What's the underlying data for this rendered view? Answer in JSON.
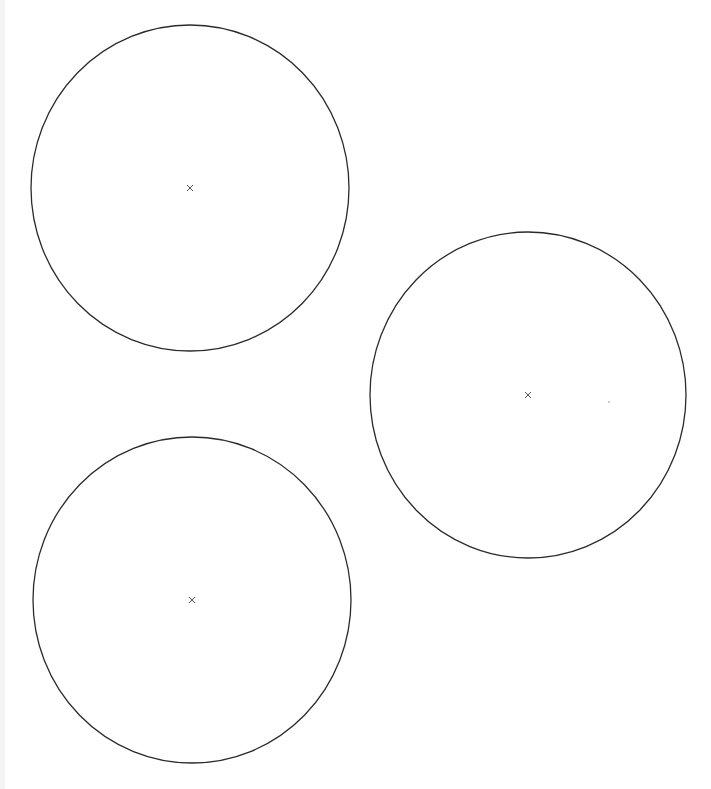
{
  "canvas": {
    "width": 711,
    "height": 789,
    "background": "#ffffff"
  },
  "stroke_color": "#2a2a2a",
  "marker_color": "#555555",
  "circles": [
    {
      "id": "circle-top-left",
      "cx": 190,
      "cy": 188,
      "rx": 159,
      "ry": 163,
      "center_marker": "x"
    },
    {
      "id": "circle-right",
      "cx": 528,
      "cy": 395,
      "rx": 158,
      "ry": 163,
      "center_marker": "x"
    },
    {
      "id": "circle-bottom-left",
      "cx": 192,
      "cy": 600,
      "rx": 159,
      "ry": 163,
      "center_marker": "x"
    }
  ],
  "stray_points": [
    {
      "x": 609,
      "y": 402
    }
  ]
}
